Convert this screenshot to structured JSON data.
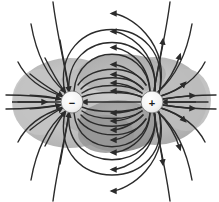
{
  "figure": {
    "kind": "physics-field-line-diagram",
    "background_color": "#ffffff",
    "width": 219,
    "height": 202
  },
  "colors": {
    "background": "#ffffff",
    "field_line": "#2b2b2b",
    "cloud_light": "#c9c9c9",
    "cloud_mid": "#b2b2b2",
    "cloud_dark": "#9a9a9a",
    "cloud_darkest": "#8a8a8a",
    "charge_fill": "#f2f2f2",
    "charge_stroke": "#555555",
    "charge_text": "#1c1c1c"
  },
  "charges": [
    {
      "id": "negative-charge",
      "sign": "−",
      "polarity": "negative",
      "cx": 72,
      "cy": 102,
      "r": 11
    },
    {
      "id": "positive-charge",
      "sign": "+",
      "polarity": "positive",
      "cx": 152,
      "cy": 102,
      "r": 11
    }
  ],
  "field": {
    "direction": "from positive charge to negative charge",
    "line_count": 20,
    "arrowhead_count": 58,
    "stroke_width": 1.4
  },
  "cloud": {
    "description": "gray shaded equipotential-like blob enclosing both charges",
    "extent_x": [
      14,
      205
    ],
    "extent_y": [
      58,
      150
    ]
  }
}
